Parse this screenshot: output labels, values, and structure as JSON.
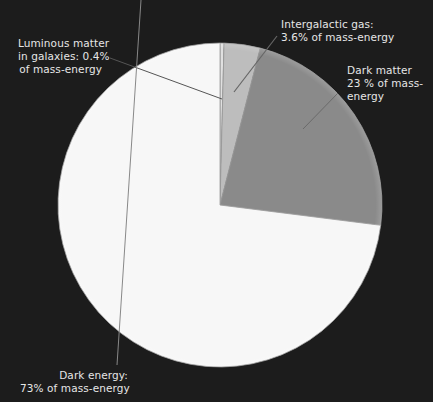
{
  "chart_data": {
    "type": "pie",
    "title": "",
    "categories": [
      "Luminous matter in galaxies",
      "Intergalactic gas",
      "Dark matter",
      "Dark energy"
    ],
    "values": [
      0.4,
      3.6,
      23,
      73
    ],
    "unit": "% of mass-energy",
    "start_angle": "12 o'clock, clockwise",
    "colors": [
      "#e0e0e0",
      "#bdbdbd",
      "#8a8a8a",
      "#f7f7f7"
    ],
    "legend": "none (callout labels with leader lines)",
    "background": "#1c1c1c"
  },
  "labels": {
    "luminous": {
      "line1": "Luminous matter",
      "line2": "in galaxies: 0.4%",
      "line3": "of mass-energy"
    },
    "gas": {
      "line1": "Intergalactic gas:",
      "line2": "3.6% of mass-energy"
    },
    "dark_matter": {
      "line1": "Dark matter",
      "line2": "23 % of mass-",
      "line3": "energy"
    },
    "dark_energy": {
      "line1": "Dark energy:",
      "line2": "73% of mass-energy"
    }
  }
}
